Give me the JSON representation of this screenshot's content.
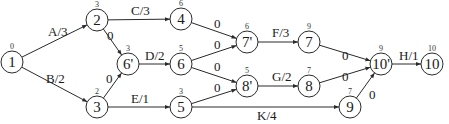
{
  "diagram": {
    "type": "activity-on-arrow network",
    "nodes": [
      {
        "id": "n1",
        "label": "1",
        "time": "0",
        "x": 12,
        "y": 62
      },
      {
        "id": "n2",
        "label": "2",
        "time": "3",
        "x": 97,
        "y": 20
      },
      {
        "id": "n3",
        "label": "3",
        "time": "2",
        "x": 97,
        "y": 107
      },
      {
        "id": "n6p",
        "label": "6'",
        "time": "3",
        "x": 128,
        "y": 64
      },
      {
        "id": "n4",
        "label": "4",
        "time": "6",
        "x": 181,
        "y": 19
      },
      {
        "id": "n6",
        "label": "6",
        "time": "5",
        "x": 181,
        "y": 64
      },
      {
        "id": "n5",
        "label": "5",
        "time": "3",
        "x": 181,
        "y": 107
      },
      {
        "id": "n7p",
        "label": "7'",
        "time": "6",
        "x": 247,
        "y": 42
      },
      {
        "id": "n8p",
        "label": "8'",
        "time": "5",
        "x": 247,
        "y": 86
      },
      {
        "id": "n7",
        "label": "7",
        "time": "9",
        "x": 309,
        "y": 42
      },
      {
        "id": "n8",
        "label": "8",
        "time": "7",
        "x": 309,
        "y": 86
      },
      {
        "id": "n9",
        "label": "9",
        "time": "7",
        "x": 350,
        "y": 107
      },
      {
        "id": "n10p",
        "label": "10'",
        "time": "9",
        "x": 381,
        "y": 64
      },
      {
        "id": "n10",
        "label": "10",
        "time": "10",
        "x": 432,
        "y": 64
      }
    ],
    "edges": [
      {
        "from": "n1",
        "to": "n2",
        "label": "A/3",
        "lx": 48,
        "ly": 36
      },
      {
        "from": "n1",
        "to": "n3",
        "label": "B/2",
        "lx": 46,
        "ly": 83
      },
      {
        "from": "n2",
        "to": "n6p",
        "label": "0",
        "lx": 107,
        "ly": 40
      },
      {
        "from": "n3",
        "to": "n6p",
        "label": "0",
        "lx": 106,
        "ly": 83
      },
      {
        "from": "n2",
        "to": "n4",
        "label": "C/3",
        "lx": 131,
        "ly": 15
      },
      {
        "from": "n6p",
        "to": "n6",
        "label": "D/2",
        "lx": 145,
        "ly": 60
      },
      {
        "from": "n3",
        "to": "n5",
        "label": "E/1",
        "lx": 131,
        "ly": 103
      },
      {
        "from": "n4",
        "to": "n7p",
        "label": "0",
        "lx": 214,
        "ly": 28
      },
      {
        "from": "n6",
        "to": "n7p",
        "label": "0",
        "lx": 214,
        "ly": 49
      },
      {
        "from": "n6",
        "to": "n8p",
        "label": "0",
        "lx": 214,
        "ly": 71
      },
      {
        "from": "n5",
        "to": "n8p",
        "label": "0",
        "lx": 214,
        "ly": 92
      },
      {
        "from": "n7p",
        "to": "n7",
        "label": "F/3",
        "lx": 272,
        "ly": 37
      },
      {
        "from": "n8p",
        "to": "n8",
        "label": "G/2",
        "lx": 272,
        "ly": 81
      },
      {
        "from": "n5",
        "to": "n9",
        "label": "K/4",
        "lx": 257,
        "ly": 120
      },
      {
        "from": "n7",
        "to": "n10p",
        "label": "0",
        "lx": 342,
        "ly": 60
      },
      {
        "from": "n8",
        "to": "n10p",
        "label": "0",
        "lx": 342,
        "ly": 81
      },
      {
        "from": "n9",
        "to": "n10p",
        "label": "0",
        "lx": 369,
        "ly": 99
      },
      {
        "from": "n10p",
        "to": "n10",
        "label": "H/1",
        "lx": 399,
        "ly": 60
      }
    ]
  }
}
